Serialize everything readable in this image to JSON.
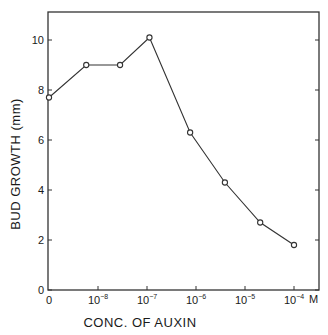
{
  "chart_data": {
    "type": "line",
    "title": "",
    "xlabel": "CONC. OF AUXIN",
    "ylabel": "BUD GROWTH (mm)",
    "x_unit_label": "M",
    "x_scale": "log (with 0 at origin)",
    "x_tick_labels": [
      "0",
      "10^-8",
      "10^-7",
      "10^-6",
      "10^-5",
      "10^-4"
    ],
    "x_ticks": [
      {
        "label": "0",
        "base": "0",
        "exp": "",
        "log": null
      },
      {
        "label": "10^-8",
        "base": "10",
        "exp": "-8",
        "log": -8
      },
      {
        "label": "10^-7",
        "base": "10",
        "exp": "-7",
        "log": -7
      },
      {
        "label": "10^-6",
        "base": "10",
        "exp": "-6",
        "log": -6
      },
      {
        "label": "10^-5",
        "base": "10",
        "exp": "-5",
        "log": -5
      },
      {
        "label": "10^-4",
        "base": "10",
        "exp": "-4",
        "log": -4
      }
    ],
    "y_tick_labels": [
      "0",
      "2",
      "4",
      "6",
      "8",
      "10"
    ],
    "y_ticks": [
      0,
      2,
      4,
      6,
      8,
      10
    ],
    "ylim": [
      0,
      11
    ],
    "grid": false,
    "legend": null,
    "marker": "open-circle",
    "line_color": "#333333",
    "series": [
      {
        "name": "Bud growth",
        "points": [
          {
            "conc": "0",
            "log": null,
            "y": 7.7
          },
          {
            "conc": "~6e-9",
            "log": -8.24,
            "y": 9.0
          },
          {
            "conc": "~3e-8",
            "log": -7.55,
            "y": 9.0
          },
          {
            "conc": "~1e-7",
            "log": -6.95,
            "y": 10.1
          },
          {
            "conc": "~8e-7",
            "log": -6.12,
            "y": 6.3
          },
          {
            "conc": "~4e-6",
            "log": -5.41,
            "y": 4.3
          },
          {
            "conc": "~2e-5",
            "log": -4.69,
            "y": 2.7
          },
          {
            "conc": "1e-4",
            "log": -4.0,
            "y": 1.8
          }
        ]
      }
    ]
  }
}
